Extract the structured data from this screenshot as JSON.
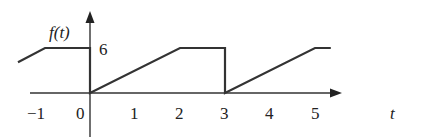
{
  "chart_data": {
    "type": "line",
    "title": "",
    "xlabel": "t",
    "ylabel": "f(t)",
    "xlim": [
      -1.6,
      5.8
    ],
    "ylim": [
      0,
      6
    ],
    "x_ticks": [
      "−1",
      "0",
      "1",
      "2",
      "3",
      "4",
      "5"
    ],
    "y_ticks": [
      "6"
    ],
    "grid": false,
    "legend": null,
    "series": [
      {
        "name": "f(t)",
        "points": [
          [
            -1.6,
            4.1
          ],
          [
            -1,
            6
          ],
          [
            0,
            6
          ],
          [
            0,
            0
          ],
          [
            2,
            6
          ],
          [
            3,
            6
          ],
          [
            3,
            0
          ],
          [
            5,
            6
          ],
          [
            5.35,
            6
          ]
        ]
      }
    ],
    "annotations": []
  },
  "labels": {
    "ylabel": "f(t)",
    "xlabel": "t",
    "y6": "6",
    "xm1": "−1",
    "x0": "0",
    "x1": "1",
    "x2": "2",
    "x3": "3",
    "x4": "4",
    "x5": "5"
  }
}
